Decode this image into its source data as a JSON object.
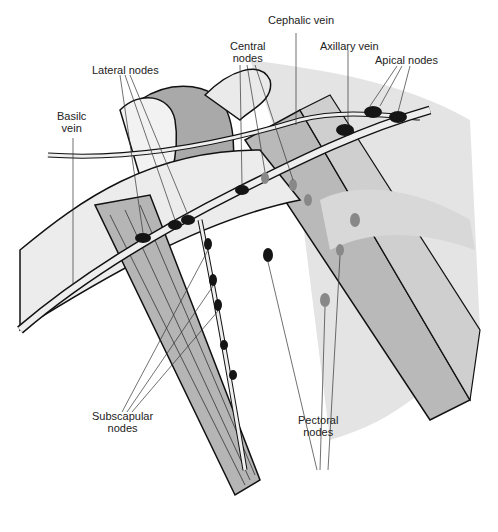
{
  "diagram": {
    "type": "anatomical illustration",
    "labels": {
      "cephalic_vein": "Cephalic vein",
      "central_nodes": "Central\nnodes",
      "axillary_vein": "Axillary vein",
      "apical_nodes": "Apical nodes",
      "lateral_nodes": "Lateral nodes",
      "basilic_vein": "Basilc\nvein",
      "subscapular_nodes": "Subscapular\nnodes",
      "pectoral_nodes": "Pectoral\nnodes"
    },
    "colors": {
      "line": "#111111",
      "muscle_gray": "#b8b8b8",
      "light_gray": "#dcdcdc",
      "dark_gray": "#8f8f8f",
      "node": "#151515",
      "background": "#ffffff"
    }
  }
}
